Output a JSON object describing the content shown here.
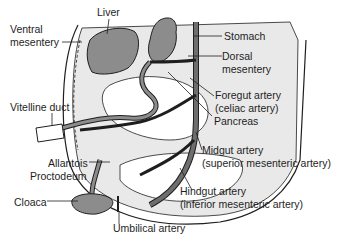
{
  "diagram": {
    "colors": {
      "mesentery_fill": "#e9e9e9",
      "organ_fill": "#8c8c8c",
      "vessel_fill": "#6e6e6e",
      "outline": "#1e1e1e",
      "text": "#1e1e1e"
    },
    "labels": {
      "liver": "Liver",
      "ventral_mesentery_1": "Ventral",
      "ventral_mesentery_2": "mesentery",
      "stomach": "Stomach",
      "dorsal_mesentery_1": "Dorsal",
      "dorsal_mesentery_2": "mesentery",
      "foregut_artery_1": "Foregut artery",
      "foregut_artery_2": "(celiac artery)",
      "pancreas": "Pancreas",
      "vitelline_duct": "Vitelline duct",
      "midgut_artery_1": "Midgut artery",
      "midgut_artery_2": "(superior mesenteric artery)",
      "allantois": "Allantois",
      "proctodeum": "Proctodeum",
      "hindgut_artery_1": "Hindgut artery",
      "hindgut_artery_2": "(inferior mesenteric artery)",
      "cloaca": "Cloaca",
      "umbilical_artery": "Umbilical artery"
    }
  }
}
